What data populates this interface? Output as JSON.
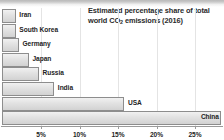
{
  "chart_data": {
    "type": "bar",
    "orientation": "horizontal",
    "title_line1": "Estimated percentage share of total",
    "title_line2_pre": "world CO",
    "title_line2_sub": "2",
    "title_line2_post": " emissions (2016)",
    "title": "Estimated percentage share of total world CO2 emissions (2016)",
    "xlabel": "",
    "ylabel": "",
    "xlim": [
      0,
      28.5
    ],
    "grid": false,
    "legend": "none",
    "categories": [
      "Iran",
      "South Korea",
      "Germany",
      "Japan",
      "Russia",
      "India",
      "USA",
      "China"
    ],
    "values": [
      1.8,
      1.8,
      2.2,
      3.5,
      4.8,
      6.8,
      15.9,
      28.5
    ],
    "tick_labels": [
      "5%",
      "10%",
      "15%",
      "20%",
      "25%"
    ],
    "tick_values": [
      5,
      10,
      15,
      20,
      25
    ],
    "bars": [
      {
        "label": "Iran",
        "value": 1.8,
        "label_position": "outside"
      },
      {
        "label": "South Korea",
        "value": 1.8,
        "label_position": "outside"
      },
      {
        "label": "Germany",
        "value": 2.2,
        "label_position": "outside"
      },
      {
        "label": "Japan",
        "value": 3.5,
        "label_position": "outside"
      },
      {
        "label": "Russia",
        "value": 4.8,
        "label_position": "outside"
      },
      {
        "label": "India",
        "value": 6.8,
        "label_position": "outside"
      },
      {
        "label": "USA",
        "value": 15.9,
        "label_position": "outside"
      },
      {
        "label": "China",
        "value": 28.5,
        "label_position": "inside"
      }
    ],
    "colors": {
      "bar_fill_top": "#f1f1f1",
      "bar_fill_bottom": "#d2d2d2",
      "bar_border": "#8d8d8d",
      "text": "#232323",
      "title_text": "#2b2b2b",
      "axis": "#9a9a9a",
      "background": "#ffffff"
    }
  }
}
